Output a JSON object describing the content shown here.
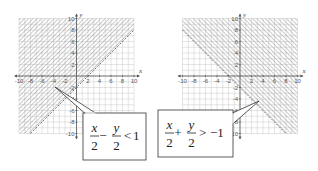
{
  "figure": {
    "graphs": [
      {
        "id": "graph-left",
        "inequality": {
          "num_left": "x",
          "den_left": "2",
          "op": "−",
          "num_right": "y",
          "den_right": "2",
          "relation": "<",
          "rhs": "1"
        },
        "boundary": "y = x - 2",
        "shaded_side": "above-left",
        "x_label": "x",
        "y_label": "y",
        "x_ticks": [
          "-10",
          "-8",
          "-6",
          "-4",
          "-2",
          "2",
          "4",
          "6",
          "8",
          "10"
        ],
        "y_ticks": [
          "10",
          "8",
          "6",
          "4",
          "2",
          "-2",
          "-4",
          "-6",
          "-8",
          "-10"
        ]
      },
      {
        "id": "graph-right",
        "inequality": {
          "num_left": "x",
          "den_left": "2",
          "op": "+",
          "num_right": "y",
          "den_right": "2",
          "relation": ">",
          "rhs": "−1"
        },
        "boundary": "y = -x - 2",
        "shaded_side": "above-right",
        "x_label": "x",
        "y_label": "y",
        "x_ticks": [
          "-10",
          "-8",
          "-6",
          "-4",
          "-2",
          "2",
          "4",
          "6",
          "8",
          "10"
        ],
        "y_ticks": [
          "10",
          "8",
          "6",
          "4",
          "2",
          "-2",
          "-4",
          "-6",
          "-8",
          "-10"
        ]
      }
    ],
    "colors": {
      "grid": "#c8c8c8",
      "hatch": "#9a9a9a",
      "axis": "#555555",
      "box_border": "#333333"
    }
  }
}
